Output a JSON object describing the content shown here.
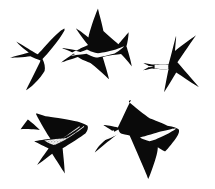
{
  "artwork": {
    "title": "Swallows and martins in flight",
    "description": "Black ink silhouette illustration of five hirundines in flight on a plain white background",
    "type": "line-art-illustration",
    "width": 215,
    "height": 189,
    "background_color": "#ffffff",
    "ink_color": "#0a0a0a",
    "pale_color": "#ffffff",
    "stipple_color": "#9a9a9a",
    "subject_count": 5
  },
  "birds": [
    {
      "id": "bird-top-left",
      "label": "Swallow, upper left, banking with forked tail to the left",
      "species": "barn-swallow",
      "fill": "#0a0a0a",
      "bbox": {
        "x": 10,
        "y": 28,
        "width": 62,
        "height": 62
      },
      "body_path": "M64.5,30.5 C61.5,35.5 57.5,41.5 52.5,47.5 C48.5,52.5 45.0,56.5 42.5,59.0 C43.5,61.0 44.2,63.0 44.6,65.0 C45.0,67.2 45.0,69.2 44.6,71.0 C42.6,74.5 39.0,79.0 34.5,83.5 C31.0,87.0 28.0,89.3 26.0,90.3 C27.6,87.0 29.8,82.6 32.2,77.8 C35.0,72.2 37.4,67.4 39.0,64.0 C39.8,62.3 40.3,61.1 40.5,60.4 C39.0,60.0 37.2,59.4 35.2,58.6 C33.2,57.8 31.6,57.0 30.4,56.3 C27.5,56.8 23.0,57.3 17.5,57.6 C13.5,57.8 10.8,57.8 9.5,57.6 C12.0,56.9 15.5,56.0 19.8,54.9 C24.0,53.8 27.0,53.0 28.8,52.5 C27.0,51.3 24.8,49.6 22.3,47.5 C19.6,45.2 17.6,43.2 16.3,41.6 C18.8,43.0 22.0,44.9 25.8,47.2 C29.4,49.4 32.2,51.1 34.0,52.2 C35.5,53.1 36.8,53.8 37.8,54.3 C40.0,52.0 43.0,48.8 46.5,44.8 C51.5,39.2 56.0,34.6 59.5,31.7 C61.5,30.0 63.2,29.2 64.5,28.6 Z",
      "pale_marks": []
    },
    {
      "id": "bird-top-middle",
      "label": "Swallow, upper middle, pale belly with very long tail streamers to the left",
      "species": "barn-swallow",
      "fill": "#0a0a0a",
      "bbox": {
        "x": 62,
        "y": 6,
        "width": 70,
        "height": 76
      },
      "body_path": "M98.0,8.5 C96.0,13.0 94.0,18.5 92.0,24.5 C90.2,30.0 89.0,34.3 88.4,37.4 C87.0,36.2 85.2,34.8 83.0,33.2 C80.0,31.0 77.6,29.4 75.8,28.3 C77.4,30.8 79.6,34.0 82.4,37.8 C84.8,41.0 86.7,43.4 88.0,44.9 C86.5,45.6 84.6,46.5 82.4,47.6 C80.0,48.8 78.2,49.8 77.0,50.5 C74.2,49.8 70.4,49.1 65.8,48.5 C63.5,48.2 62.0,48.1 62.0,48.1 C62.0,48.1 63.4,48.7 65.6,49.6 C69.2,51.1 72.0,52.3 74.0,53.3 C72.4,54.4 70.2,55.9 67.5,57.8 C64.5,59.9 62.3,61.5 61.0,62.6 C63.0,62.0 65.8,61.0 69.4,59.8 C73.2,58.5 76.0,57.5 77.8,56.9 C79.4,58.0 81.6,59.2 84.4,60.5 C87.0,61.7 89.0,62.5 90.4,63.0 C92.8,64.7 96.0,67.4 100.0,71.0 C104.0,74.6 107.0,77.4 109.0,79.3 C108.4,76.6 107.4,72.8 106.0,68.0 C104.6,63.2 103.5,59.6 102.7,57.2 C105.2,56.5 108.5,55.8 112.6,55.1 C116.4,54.5 119.2,54.1 121.0,53.9 C122.6,55.4 124.6,57.6 127.0,60.5 C129.2,63.1 130.8,65.1 131.8,66.4 C131.4,64.0 130.6,60.6 129.4,56.2 C128.2,51.8 127.2,48.5 126.4,46.3 C126.9,44.6 127.4,42.3 127.9,39.4 C128.4,36.4 128.6,34.0 128.6,32.2 C127.4,33.6 125.7,35.6 123.5,38.2 C121.3,40.8 119.6,42.8 118.4,44.2 C116.4,42.6 113.8,40.4 110.6,37.6 C107.4,34.8 105.0,32.6 103.4,31.0 C102.6,27.0 101.4,22.0 99.8,16.0 C98.9,12.6 98.3,10.2 98.0,8.5 Z",
      "pale_marks": [
        {
          "id": "belly-top-middle",
          "label": "pale underside and tail streamer highlight",
          "fill": "#fbfbfb",
          "path": "M122.0,47.0 C120.0,48.0 117.0,49.2 113.0,50.3 C108.5,51.5 105.0,52.2 102.4,52.6 C100.5,52.9 99.0,53.1 98.0,53.2 C96.2,53.0 94.2,52.6 92.0,51.8 C89.8,51.0 88.2,50.2 87.0,49.5 C84.8,50.3 82.0,51.4 78.6,52.7 C75.0,54.1 72.4,55.1 70.8,55.8 C72.4,55.6 75.0,55.2 78.6,54.7 C82.2,54.2 84.8,53.9 86.4,53.7 C87.6,54.4 89.2,55.2 91.2,56.0 C93.2,56.8 94.8,57.3 96.0,57.6 C98.2,57.3 101.2,56.7 105.0,55.9 C109.2,55.0 112.4,54.2 114.6,53.6 C117.0,52.2 119.4,50.5 121.8,48.6 C123.2,47.4 123.6,46.8 124.0,46.2 Z"
        },
        {
          "id": "streamer-gap-top-middle",
          "label": "white separation between the two tail streamers",
          "fill": "#ffffff",
          "path": "M75.5,50.8 C78.0,51.4 80.5,52.0 83.0,52.8 C80.5,53.2 78.0,53.7 75.5,54.3 C74.0,53.9 72.8,53.4 72.0,52.8 C72.8,52.0 74.0,51.3 75.5,50.8 Z"
        }
      ]
    },
    {
      "id": "bird-top-right",
      "label": "House martin, right side, white rump and short square tail to the left",
      "species": "house-martin",
      "fill": "#0a0a0a",
      "bbox": {
        "x": 143,
        "y": 33,
        "width": 68,
        "height": 68
      },
      "body_path": "M176.0,36.0 C174.8,40.6 173.4,46.0 171.8,52.2 C170.4,57.6 169.4,61.6 168.6,64.2 C166.6,64.0 164.0,63.9 160.8,64.0 C157.0,64.1 154.0,64.3 152.0,64.6 C152.0,64.6 152.0,64.6 152.0,64.6 C150.4,64.2 148.5,63.8 146.4,63.4 C144.6,63.1 143.2,62.9 143.2,62.9 C143.2,62.9 144.5,63.6 146.2,64.6 C147.6,65.4 148.7,66.1 149.4,66.6 C148.7,67.1 147.6,67.8 146.2,68.6 C144.5,69.6 143.2,70.3 143.2,70.3 C143.2,70.3 144.6,70.1 146.4,69.8 C148.5,69.4 150.4,69.0 152.0,68.6 C154.0,68.9 157.0,69.1 160.8,69.2 C164.0,69.3 166.6,69.2 168.6,69.0 C168.0,71.8 167.2,75.8 166.2,80.8 C165.2,86.0 164.5,89.8 164.2,92.2 C165.6,90.0 167.6,86.8 170.2,82.6 C172.8,78.4 174.8,75.0 176.2,72.6 C179.0,74.4 183.0,77.0 188.2,80.4 C193.0,83.5 196.6,85.8 199.0,87.3 C196.2,84.0 192.4,79.6 187.6,74.0 C183.2,69.0 179.8,65.0 177.4,62.2 C180.0,58.4 183.4,53.5 187.6,47.4 C191.4,41.9 194.2,37.8 196.0,35.2 C193.2,37.2 189.4,40.0 184.6,43.6 C180.2,46.9 177.0,49.4 175.0,51.0 C175.2,48.0 175.5,44.0 176.0,39.0 C176.2,37.4 176.1,36.5 176.0,36.0 Z",
      "pale_marks": [
        {
          "id": "rump-band-top-right",
          "label": "white rump band and pale tail base",
          "fill": "#fbfbfb",
          "path": "M168.4,64.6 C167.0,64.4 165.0,64.3 162.4,64.3 C159.0,64.3 156.4,64.5 154.6,64.8 C154.6,66.0 154.6,67.4 154.6,68.6 C156.4,68.9 159.0,69.1 162.4,69.1 C165.0,69.1 167.0,69.0 168.4,68.8 C168.2,67.4 168.2,66.0 168.4,64.6 Z"
        },
        {
          "id": "tail-notch-top-right",
          "label": "white notch in the short forked tail",
          "fill": "#ffffff",
          "path": "M149.0,66.0 C150.5,66.2 152.0,66.4 153.6,66.6 C152.0,66.9 150.5,67.1 149.0,67.3 C148.4,66.9 148.4,66.4 149.0,66.0 Z"
        }
      ]
    },
    {
      "id": "bird-bottom-left",
      "label": "Martin, lower left, stippled grey underparts and swept-back wings",
      "species": "sand-martin",
      "fill": "#0a0a0a",
      "bbox": {
        "x": 20,
        "y": 110,
        "width": 68,
        "height": 64
      },
      "body_path": "M36.0,114.0 C38.0,118.0 40.6,122.8 43.8,128.2 C46.6,132.9 48.8,136.4 50.4,138.8 C48.4,139.0 45.6,139.4 42.0,139.9 C38.4,140.4 35.8,140.9 34.2,141.3 C35.8,142.2 38.2,143.4 41.4,145.0 C44.6,146.6 47.0,147.7 48.6,148.4 C47.0,150.5 45.0,153.3 42.6,156.8 C40.2,160.3 38.4,163.0 37.2,164.9 C39.2,163.5 41.8,161.6 45.0,159.2 C48.2,156.8 50.6,155.0 52.2,153.7 C54.2,156.8 56.6,160.6 59.4,165.0 C61.8,168.8 63.6,171.6 64.8,173.4 C64.6,170.0 64.3,165.6 63.8,160.2 C63.3,154.8 62.9,150.8 62.6,148.2 C66.0,146.2 70.2,143.6 75.2,140.4 C79.8,137.5 83.2,135.2 85.4,133.6 C86.4,132.2 87.2,130.8 87.6,129.4 C88.0,128.0 88.0,126.8 87.6,125.8 C86.0,124.8 83.8,123.8 81.0,122.8 C78.2,121.8 76.0,121.2 74.4,121.0 C70.0,120.0 64.6,119.0 58.2,118.0 C52.8,117.2 48.6,116.6 45.6,116.2 C43.2,115.4 40.6,114.6 37.8,113.8 C36.4,113.4 36.0,113.6 36.0,114.0 Z M20.6,129.2 C23.4,129.0 27.0,129.0 31.4,129.2 C35.0,129.4 37.8,129.7 39.8,130.0 C38.4,128.5 36.4,126.6 33.8,124.3 C31.2,122.0 29.2,120.4 27.8,119.4 C25.4,122.4 23.0,125.6 20.6,129.2 Z",
      "pale_marks": [
        {
          "id": "belly-bottom-left",
          "label": "grey stippled underparts",
          "fill": "#a9a9a9",
          "path": "M84.0,127.0 C81.0,129.4 77.0,132.2 72.0,135.4 C67.0,138.6 63.0,140.9 60.0,142.4 C57.6,143.6 55.6,144.5 54.0,145.0 C52.4,144.5 50.6,143.8 48.6,142.9 C46.6,142.0 45.2,141.2 44.2,140.6 C47.0,140.1 50.8,139.6 55.6,139.1 C60.4,138.6 64.0,138.2 66.4,138.0 C69.2,136.4 72.6,134.2 76.6,131.4 C80.2,128.9 82.8,127.0 84.2,125.8 Z"
        },
        {
          "id": "belly-highlight-bottom-left",
          "label": "pale highlight on breast",
          "fill": "#d8d8d8",
          "path": "M80.0,127.0 C77.5,129.0 74.5,131.0 71.0,133.2 C67.5,135.4 64.8,137.0 63.0,138.0 C65.2,136.5 68.0,134.5 71.4,132.0 C74.8,129.5 77.4,127.6 79.2,126.2 Z"
        }
      ]
    },
    {
      "id": "bird-bottom-right",
      "label": "Barn swallow, lower right, long tail streamers trailing to the lower left",
      "species": "barn-swallow",
      "fill": "#0a0a0a",
      "bbox": {
        "x": 95,
        "y": 98,
        "width": 85,
        "height": 88
      },
      "body_path": "M131.0,100.0 C129.0,104.0 126.6,109.0 123.8,115.0 C121.2,120.5 119.2,124.7 117.8,127.6 C115.8,127.0 113.2,126.4 110.0,125.8 C107.2,125.3 105.0,125.0 103.4,124.9 C104.6,125.8 106.4,127.0 108.8,128.6 C111.0,130.0 112.8,131.2 114.0,132.0 C112.2,133.6 109.8,135.8 106.8,138.6 C103.4,141.8 100.8,144.2 99.0,146.0 C96.8,148.8 95.4,151.0 94.8,152.6 C96.6,151.0 99.2,148.8 102.6,146.0 C106.4,142.9 109.4,140.5 111.6,138.8 C114.4,136.6 117.0,134.6 119.4,132.8 C120.8,133.4 122.6,134.0 124.8,134.6 C126.8,135.1 128.4,135.4 129.6,135.5 C131.6,139.9 134.2,145.8 137.4,153.2 C140.6,160.6 143.0,166.2 144.6,170.0 C146.2,173.8 147.4,176.8 148.2,179.0 C149.4,176.4 150.8,172.8 152.4,168.2 C154.4,162.6 155.8,158.2 156.6,155.0 C157.4,151.8 157.8,149.2 157.8,147.2 C158.6,147.8 159.8,148.6 161.4,149.6 C163.0,150.6 164.2,151.2 165.0,151.4 C166.6,150.0 168.6,147.8 171.0,144.8 C173.4,141.8 175.2,139.4 176.4,137.6 C177.6,135.8 178.4,134.2 178.8,132.8 C179.2,131.4 179.2,130.3 178.8,129.4 C177.6,128.6 175.8,127.8 173.4,127.0 C171.0,126.2 169.0,125.8 167.4,125.7 C165.0,124.6 162.0,123.3 158.4,121.8 C154.8,120.3 152.0,119.2 150.0,118.5 C147.2,116.5 143.6,113.8 139.2,110.4 C134.8,107.0 131.6,104.4 129.6,102.6 C128.4,101.4 128.6,100.4 131.0,100.0 Z",
      "pale_marks": [
        {
          "id": "belly-bottom-right",
          "label": "pale throat and belly wedge",
          "fill": "#fbfbfb",
          "path": "M176.0,128.8 C173.6,130.6 170.2,132.6 165.8,134.8 C161.4,137.0 158.0,138.5 155.6,139.4 C153.2,140.3 151.2,140.9 149.6,141.2 C148.0,140.9 146.2,140.4 144.2,139.6 C142.2,138.8 140.8,138.1 140.0,137.4 C142.8,136.6 146.4,135.6 150.8,134.4 C155.2,133.2 158.4,132.3 160.6,131.6 C163.8,130.8 167.2,130.0 170.8,129.2 C174.4,128.4 176.0,128.4 176.0,128.8 Z"
        },
        {
          "id": "streamers-bottom-right",
          "label": "pale highlight along the long tail streamers",
          "fill": "#fbfbfb",
          "path": "M118.4,129.4 C115.0,131.4 110.6,134.0 105.2,137.4 C100.2,140.6 96.8,142.9 95.0,144.4 C96.8,143.6 100.2,142.1 105.2,140.0 C110.2,137.9 113.8,136.4 116.0,135.4 C117.8,134.6 119.4,134.0 120.8,133.6 C119.8,132.6 119.0,131.2 118.4,129.4 Z"
        },
        {
          "id": "streamer-split-bottom-right",
          "label": "white gap separating the two outer tail feathers",
          "fill": "#ffffff",
          "path": "M115.0,132.4 C111.0,135.0 107.0,137.6 103.2,140.2 C106.0,137.0 109.4,133.6 113.2,130.0 C113.8,130.8 114.4,131.6 115.0,132.4 Z"
        }
      ]
    }
  ]
}
